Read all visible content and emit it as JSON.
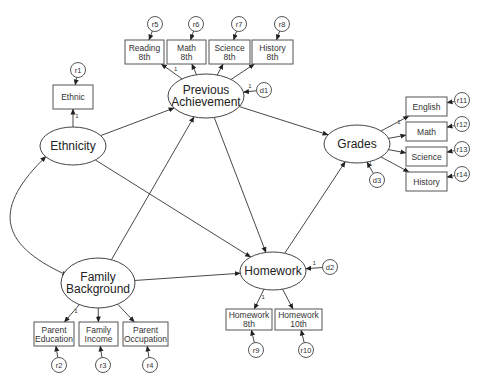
{
  "diagram": {
    "type": "structural-equation-model",
    "latent": [
      {
        "id": "ethnicity",
        "label": [
          "Ethnicity"
        ]
      },
      {
        "id": "prev",
        "label": [
          "Previous",
          "Achievement"
        ]
      },
      {
        "id": "family",
        "label": [
          "Family",
          "Background"
        ]
      },
      {
        "id": "homework",
        "label": [
          "Homework"
        ]
      },
      {
        "id": "grades",
        "label": [
          "Grades"
        ]
      }
    ],
    "observed": [
      {
        "id": "ethnic",
        "label": [
          "Ethnic"
        ],
        "factor": "ethnicity",
        "error": "r1"
      },
      {
        "id": "reading8",
        "label": [
          "Reading",
          "8th"
        ],
        "factor": "prev",
        "error": "r5"
      },
      {
        "id": "math8",
        "label": [
          "Math",
          "8th"
        ],
        "factor": "prev",
        "error": "r6"
      },
      {
        "id": "science8",
        "label": [
          "Science",
          "8th"
        ],
        "factor": "prev",
        "error": "r7"
      },
      {
        "id": "history8",
        "label": [
          "History",
          "8th"
        ],
        "factor": "prev",
        "error": "r8"
      },
      {
        "id": "english",
        "label": [
          "English"
        ],
        "factor": "grades",
        "error": "r11"
      },
      {
        "id": "mathg",
        "label": [
          "Math"
        ],
        "factor": "grades",
        "error": "r12"
      },
      {
        "id": "scienceg",
        "label": [
          "Science"
        ],
        "factor": "grades",
        "error": "r13"
      },
      {
        "id": "historyg",
        "label": [
          "History"
        ],
        "factor": "grades",
        "error": "r14"
      },
      {
        "id": "pedu",
        "label": [
          "Parent",
          "Education"
        ],
        "factor": "family",
        "error": "r2"
      },
      {
        "id": "finc",
        "label": [
          "Family",
          "Income"
        ],
        "factor": "family",
        "error": "r3"
      },
      {
        "id": "pocc",
        "label": [
          "Parent",
          "Occupation"
        ],
        "factor": "family",
        "error": "r4"
      },
      {
        "id": "hw8",
        "label": [
          "Homework",
          "8th"
        ],
        "factor": "homework",
        "error": "r9"
      },
      {
        "id": "hw10",
        "label": [
          "Homework",
          "10th"
        ],
        "factor": "homework",
        "error": "r10"
      }
    ],
    "errors": [
      "r1",
      "r2",
      "r3",
      "r4",
      "r5",
      "r6",
      "r7",
      "r8",
      "r9",
      "r10",
      "r11",
      "r12",
      "r13",
      "r14"
    ],
    "disturbances": [
      {
        "id": "d1",
        "label": "d1",
        "target": "prev",
        "path_label": "1"
      },
      {
        "id": "d2",
        "label": "d2",
        "target": "homework",
        "path_label": "1"
      },
      {
        "id": "d3",
        "label": "d3",
        "target": "grades",
        "path_label": "1"
      }
    ],
    "structural_paths": [
      {
        "from": "ethnicity",
        "to": "prev"
      },
      {
        "from": "ethnicity",
        "to": "homework"
      },
      {
        "from": "family",
        "to": "prev"
      },
      {
        "from": "family",
        "to": "homework"
      },
      {
        "from": "prev",
        "to": "homework"
      },
      {
        "from": "prev",
        "to": "grades"
      },
      {
        "from": "homework",
        "to": "grades"
      }
    ],
    "correlations": [
      {
        "a": "ethnicity",
        "b": "family"
      }
    ],
    "fixed_loading_label": "1"
  }
}
